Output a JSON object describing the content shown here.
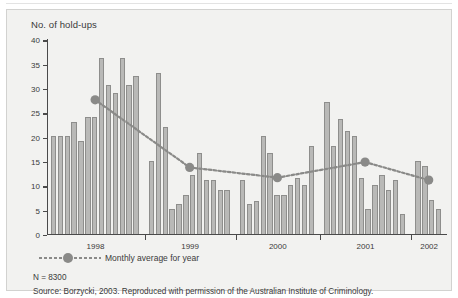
{
  "figure": {
    "title": "No. of hold-ups",
    "note_n": "N = 8300",
    "note_source": "Source: Borzycki, 2003. Reproduced with permission of the Australian Institute of Criminology.",
    "legend_label": "Monthly average for year",
    "bar_fill": "#b9b9b7",
    "bar_stroke": "#8e8e8c",
    "line_color": "#8a8a88",
    "axis_color": "#4a4a4a",
    "panel_bg": "#f2f2f0"
  },
  "chart_data": {
    "type": "bar",
    "title": "No. of hold-ups",
    "xlabel": "",
    "ylabel": "No. of hold-ups",
    "ylim": [
      0,
      40
    ],
    "yticks": [
      0,
      5,
      10,
      15,
      20,
      25,
      30,
      35,
      40
    ],
    "grid": false,
    "legend_position": "below-axes",
    "categories": [
      "1998",
      "1999",
      "2000",
      "2001",
      "2002"
    ],
    "bar_series": {
      "name": "Monthly hold-ups",
      "groups": [
        {
          "year": "1998",
          "values": [
            20,
            20,
            20,
            23,
            19,
            24,
            24,
            36,
            30.5,
            29,
            36,
            30.5,
            32.5
          ]
        },
        {
          "year": "1999",
          "values": [
            15,
            33,
            22,
            5,
            6,
            8,
            12,
            16.5,
            11,
            11,
            9,
            9
          ]
        },
        {
          "year": "2000",
          "values": [
            11,
            6,
            6.8,
            20,
            16.5,
            8,
            8,
            10,
            11.5,
            10,
            18
          ]
        },
        {
          "year": "2001",
          "values": [
            27,
            18,
            23.5,
            21,
            20,
            11.5,
            5,
            10,
            12,
            9,
            11,
            4
          ]
        },
        {
          "year": "2002",
          "values": [
            15,
            14,
            7,
            5
          ]
        }
      ]
    },
    "line_series": {
      "name": "Monthly average for year",
      "x": [
        "1998",
        "1999",
        "2000",
        "2001",
        "2002"
      ],
      "values": [
        27.5,
        13.6,
        11.5,
        14.7,
        11
      ]
    }
  },
  "yticks": [
    {
      "label": "40",
      "value": 40
    },
    {
      "label": "35",
      "value": 35
    },
    {
      "label": "30",
      "value": 30
    },
    {
      "label": "25",
      "value": 25
    },
    {
      "label": "20",
      "value": 20
    },
    {
      "label": "15",
      "value": 15
    },
    {
      "label": "10",
      "value": 10
    },
    {
      "label": "5",
      "value": 5
    },
    {
      "label": "0",
      "value": 0
    }
  ]
}
